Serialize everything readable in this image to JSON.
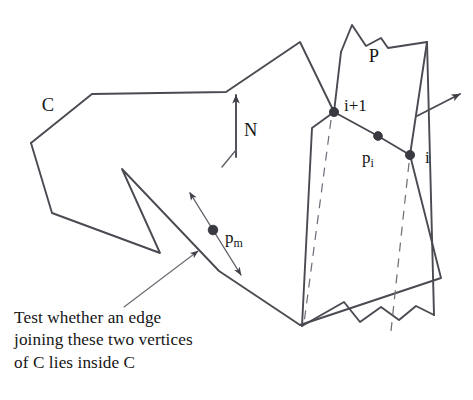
{
  "figure": {
    "type": "geometry-diagram",
    "background_color": "#ffffff",
    "ink_color": "#4a4a52",
    "labels": {
      "contour": "C",
      "polygon": "P",
      "normal": "N",
      "vertex_next": "i+1",
      "vertex_current": "i",
      "point_i_base": "p",
      "point_i_sub": "i",
      "point_m_base": "p",
      "point_m_sub": "m"
    },
    "caption": {
      "line1": "Test whether an edge",
      "line2": "joining these two vertices",
      "line3": "of C lies inside C"
    },
    "geometry": {
      "contour_C": "M 31,143 L 52,213 L 160,253 L 122,169 L 219,271 L 300,325 L 441,278 L 410,155 L 378,136 L 334,112 L 300,42 L 226,92 L 92,94 L 31,143 Z",
      "polygon_P": "M 340,40 L 352,25 L 367,45 L 381,38 L 387,47 L 427,42 L 434,315 L 415,307 L 397,320 L 380,309 L 359,322 L 343,303 L 300,325 L 310,132 L 334,112 Z",
      "polygon_P_visible_top": "M 341,52 L 352,25 L 367,45 L 381,38 L 387,47 L 427,42",
      "polygon_P_right": "M 427,42 L 434,315",
      "polygon_P_bottom_jagged": "M 434,315 L 415,306 L 399,320 L 381,307 L 360,322 L 344,302 L 302,326",
      "polygon_P_left": "M 302,326 L 312,128 L 334,112 L 341,52",
      "dashed_left": "M 332,118 L 304,322",
      "dashed_right": "M 410,162 L 392,330",
      "normal_arrow": "M 236,155 L 236,92",
      "normal_tick": "M 236,150 L 221,166",
      "outward_arrow": "M 417,116 L 463,92",
      "pm_arrow": "M 188,190 L 242,277",
      "caption_pointer": "M 125,307 L 201,249"
    },
    "vertices": [
      {
        "name": "i+1",
        "x": 334,
        "y": 112
      },
      {
        "name": "p_i",
        "x": 378,
        "y": 136
      },
      {
        "name": "i",
        "x": 410,
        "y": 155
      },
      {
        "name": "p_m",
        "x": 213,
        "y": 230
      }
    ]
  }
}
